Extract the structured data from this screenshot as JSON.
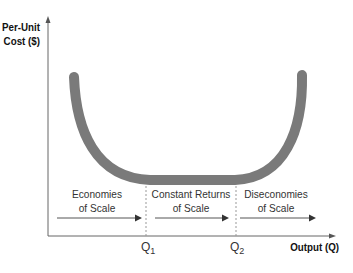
{
  "diagram": {
    "type": "long-run average cost curve",
    "y_axis": {
      "title_line1": "Per-Unit",
      "title_line2": "Cost ($)"
    },
    "x_axis": {
      "title": "Output (Q)"
    },
    "ticks": [
      {
        "base": "Q",
        "sub": "1"
      },
      {
        "base": "Q",
        "sub": "2"
      }
    ],
    "regions": [
      {
        "line1": "Economies",
        "line2": "of Scale"
      },
      {
        "line1": "Constant Returns",
        "line2": "of Scale"
      },
      {
        "line1": "Diseconomies",
        "line2": "of Scale"
      }
    ],
    "colors": {
      "curve": "#7a7a7a",
      "axis": "#555555",
      "arrow": "#444444",
      "dashed": "#999999"
    }
  }
}
